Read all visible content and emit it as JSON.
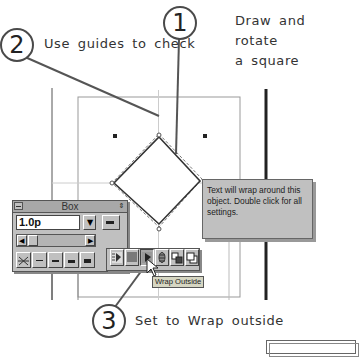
{
  "callouts": [
    {
      "number": "1",
      "text_line1": "Draw and rotate",
      "text_line2": "a square"
    },
    {
      "number": "2",
      "text": "Use guides to check"
    },
    {
      "number": "3",
      "text": "Set to Wrap outside"
    }
  ],
  "box_palette": {
    "title": "Box",
    "line_weight_value": "1.0p",
    "close_icon": "minus-box-icon",
    "menu_icon": "up-down-arrow-icon",
    "line_styles": [
      "none",
      "hairline",
      "thin",
      "medium",
      "thick"
    ],
    "wrap_buttons": [
      "wrap-none",
      "wrap-through",
      "wrap-outside",
      "wrap-inside",
      "bring-forward",
      "send-backward"
    ]
  },
  "hint_box": {
    "text": "Text will wrap around this object. Double click for all settings."
  },
  "tooltip": {
    "text": "Wrap Outside"
  },
  "colors": {
    "palette_bg": "#c0c0c0",
    "hint_bg": "#c0c0c0",
    "tooltip_bg": "#d6d6c2",
    "callout_line": "#555555"
  }
}
